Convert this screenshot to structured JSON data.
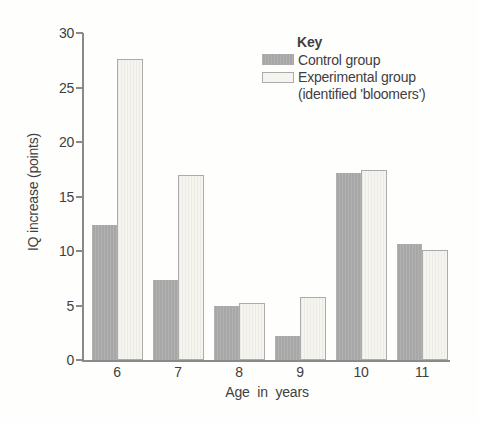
{
  "axes": {
    "ylabel": "IQ increase (points)",
    "xlabel": "Age in years"
  },
  "legend": {
    "title": "Key",
    "items": [
      {
        "label": "Control group",
        "swatch": "control-swatch"
      },
      {
        "label": "Experimental group",
        "sublabel": "(identified 'bloomers')",
        "swatch": "experimental-swatch"
      }
    ]
  },
  "colors": {
    "control_fill": "#a7a7a7",
    "experimental_fill": "#f5f4ef",
    "experimental_border": "#ababab",
    "axis": "#8a8a8a",
    "text": "#3f3f3f"
  },
  "chart_data": {
    "type": "bar",
    "categories": [
      "6",
      "7",
      "8",
      "9",
      "10",
      "11"
    ],
    "series": [
      {
        "name": "Control group",
        "values": [
          12.4,
          7.3,
          5.0,
          2.2,
          17.2,
          10.6
        ]
      },
      {
        "name": "Experimental group (identified 'bloomers')",
        "values": [
          27.6,
          17.0,
          5.2,
          5.8,
          17.4,
          10.1
        ]
      }
    ],
    "title": "",
    "xlabel": "Age in years",
    "ylabel": "IQ increase (points)",
    "ylim": [
      0,
      30
    ],
    "yticks": [
      0,
      5,
      10,
      15,
      20,
      25,
      30
    ],
    "grid": false,
    "legend_title": "Key",
    "legend_position": "top-right"
  }
}
